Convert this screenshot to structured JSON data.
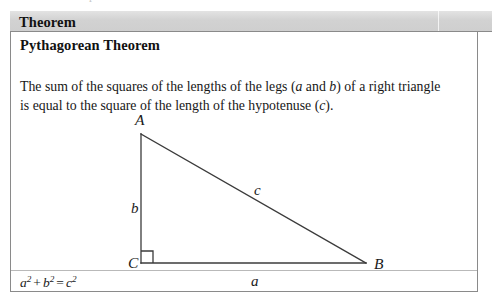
{
  "scan": {
    "top_remnant_text": "o p r"
  },
  "theorem_box": {
    "header_label": "Theorem",
    "subtitle": "Pythagorean Theorem",
    "statement": {
      "part1": "The sum of the squares of the lengths of the legs (",
      "var_a": "a",
      "part2": " and ",
      "var_b": "b",
      "part3": ") of a right triangle is equal to the square of the length of the hypotenuse (",
      "var_c": "c",
      "part4": ")."
    },
    "formula": {
      "a": "a",
      "a_exp": "2",
      "plus": "+",
      "b": "b",
      "b_exp": "2",
      "equals": "=",
      "c": "c",
      "c_exp": "2"
    }
  },
  "figure": {
    "type": "right-triangle",
    "vertices": {
      "A": {
        "label": "A",
        "x": 140,
        "y": 133
      },
      "B": {
        "label": "B",
        "x": 365,
        "y": 262
      },
      "C": {
        "label": "C",
        "x": 140,
        "y": 262
      }
    },
    "side_labels": {
      "a": {
        "label": "a",
        "x": 250,
        "y": 273,
        "side": "CB"
      },
      "b": {
        "label": "b",
        "x": 130,
        "y": 200,
        "side": "AC"
      },
      "c": {
        "label": "c",
        "x": 253,
        "y": 182,
        "side": "AB"
      }
    },
    "right_angle_marker": {
      "at": "C",
      "size": 12
    },
    "stroke_color": "#3b3b3b",
    "stroke_width": 1.3
  },
  "colors": {
    "box_border": "#8a8a8a",
    "header_band": "#d2d2d2",
    "text": "#1a1a1a",
    "rule": "#b9b9b9",
    "page_background": "#ffffff"
  }
}
